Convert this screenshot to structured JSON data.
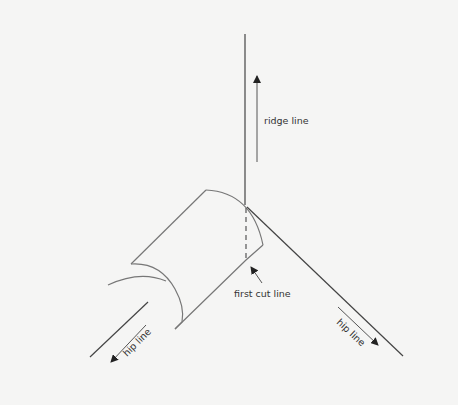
{
  "diagram": {
    "type": "roof-framing-sketch",
    "labels": {
      "ridge": "ridge line",
      "first_cut": "first cut line",
      "hip_left": "hip line",
      "hip_right": "hip line"
    },
    "colors": {
      "background": "#f5f5f4",
      "line_dark": "#444444",
      "line_gray": "#777777",
      "text": "#333333"
    }
  }
}
